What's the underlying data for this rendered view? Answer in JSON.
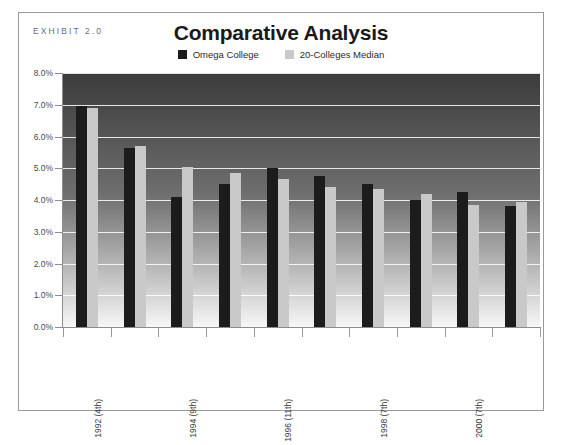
{
  "exhibit": {
    "label": "EXHIBIT 2.0"
  },
  "title": "Comparative Analysis",
  "legend": [
    {
      "name": "series-omega-college",
      "label": "Omega College",
      "color": "#1c1c1c"
    },
    {
      "name": "series-median",
      "label": "20-Colleges Median",
      "color": "#c9c9c9"
    }
  ],
  "axis": {
    "y_ticks": [
      "8.0%",
      "7.0%",
      "6.0%",
      "5.0%",
      "4.0%",
      "3.0%",
      "2.0%",
      "1.0%",
      "0.0%"
    ],
    "x_labels": [
      "1992 (4th)",
      "",
      "1994 (9th)",
      "",
      "1996 (11th)",
      "",
      "1998 (7th)",
      "",
      "2000 (7th)",
      ""
    ]
  },
  "colors": {
    "omega": "#1c1c1c",
    "median": "#c9c9c9",
    "frame": "#9a9a9a",
    "axis": "#8d8d8d",
    "plot_top": "#3b3b3b",
    "plot_bottom": "#f7f7f7",
    "gridline": "#ffffff"
  },
  "chart_data": {
    "type": "bar",
    "title": "Comparative Analysis",
    "xlabel": "",
    "ylabel": "",
    "ylim": [
      0,
      8
    ],
    "ytick_values": [
      0,
      1,
      2,
      3,
      4,
      5,
      6,
      7,
      8
    ],
    "ytick_labels": [
      "0.0%",
      "1.0%",
      "2.0%",
      "3.0%",
      "4.0%",
      "5.0%",
      "6.0%",
      "7.0%",
      "8.0%"
    ],
    "grid": true,
    "legend_position": "top-center",
    "units": "percent",
    "categories": [
      "1992 (4th)",
      "1993",
      "1994 (9th)",
      "1995",
      "1996 (11th)",
      "1997",
      "1998 (7th)",
      "1999",
      "2000 (7th)",
      "2001"
    ],
    "tick_labels_shown": [
      "1992 (4th)",
      "1994 (9th)",
      "1996 (11th)",
      "1998 (7th)",
      "2000 (7th)"
    ],
    "series": [
      {
        "name": "Omega College",
        "color": "#1c1c1c",
        "values": [
          6.95,
          5.65,
          4.1,
          4.5,
          5.0,
          4.75,
          4.5,
          4.0,
          4.25,
          3.8
        ]
      },
      {
        "name": "20-Colleges Median",
        "color": "#c9c9c9",
        "values": [
          6.9,
          5.7,
          5.05,
          4.85,
          4.65,
          4.4,
          4.35,
          4.2,
          3.85,
          3.95
        ]
      }
    ]
  }
}
